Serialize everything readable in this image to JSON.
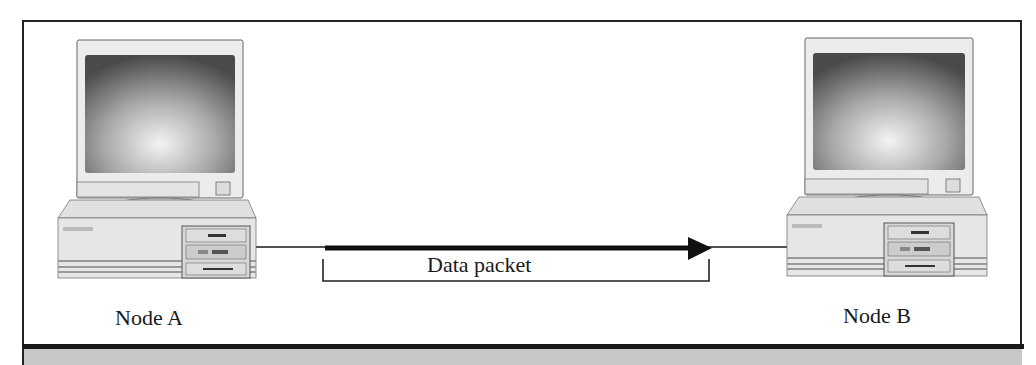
{
  "diagram": {
    "type": "network-transmission",
    "nodes": [
      {
        "id": "A",
        "label": "Node A",
        "icon": "desktop-computer-icon"
      },
      {
        "id": "B",
        "label": "Node B",
        "icon": "desktop-computer-icon"
      }
    ],
    "link": {
      "from": "A",
      "to": "B",
      "style": "line"
    },
    "packet": {
      "label": "Data packet",
      "direction": "A-to-B",
      "icon": "arrow-right-icon"
    },
    "colors": {
      "frame": "#222222",
      "band": "#c8c8c8",
      "line": "#1a1a1a"
    }
  }
}
